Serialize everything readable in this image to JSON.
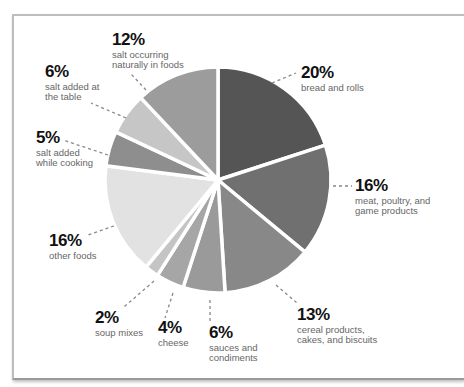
{
  "chart_data": {
    "type": "pie",
    "title": "",
    "start_angle_deg": 0,
    "direction": "clockwise",
    "slices": [
      {
        "label": "bread and rolls",
        "value": 20,
        "pct_label": "20%",
        "color": "#555555"
      },
      {
        "label": "meat, poultry, and game products",
        "value": 16,
        "pct_label": "16%",
        "color": "#707070"
      },
      {
        "label": "cereal products, cakes, and biscuits",
        "value": 13,
        "pct_label": "13%",
        "color": "#888888"
      },
      {
        "label": "sauces and condiments",
        "value": 6,
        "pct_label": "6%",
        "color": "#9a9a9a"
      },
      {
        "label": "cheese",
        "value": 4,
        "pct_label": "4%",
        "color": "#a6a6a6"
      },
      {
        "label": "soup mixes",
        "value": 2,
        "pct_label": "2%",
        "color": "#c4c4c4"
      },
      {
        "label": "other foods",
        "value": 16,
        "pct_label": "16%",
        "color": "#e2e2e2"
      },
      {
        "label": "salt added while cooking",
        "value": 5,
        "pct_label": "5%",
        "color": "#8e8e8e"
      },
      {
        "label": "salt added at the table",
        "value": 6,
        "pct_label": "6%",
        "color": "#c6c6c6"
      },
      {
        "label": "salt occurring naturally in foods",
        "value": 12,
        "pct_label": "12%",
        "color": "#9c9c9c"
      }
    ]
  },
  "labels": {
    "bread": {
      "pct": "20%",
      "desc": "bread and rolls"
    },
    "meat": {
      "pct": "16%",
      "desc": "meat, poultry, and\ngame products"
    },
    "cereal": {
      "pct": "13%",
      "desc": "cereal products,\ncakes, and biscuits"
    },
    "sauces": {
      "pct": "6%",
      "desc": "sauces and\ncondiments"
    },
    "cheese": {
      "pct": "4%",
      "desc": "cheese"
    },
    "soup": {
      "pct": "2%",
      "desc": "soup mixes"
    },
    "other": {
      "pct": "16%",
      "desc": "other foods"
    },
    "cooking": {
      "pct": "5%",
      "desc": "salt added\nwhile cooking"
    },
    "table": {
      "pct": "6%",
      "desc": "salt added at\nthe table"
    },
    "natural": {
      "pct": "12%",
      "desc": "salt occurring\nnaturally in foods"
    }
  }
}
